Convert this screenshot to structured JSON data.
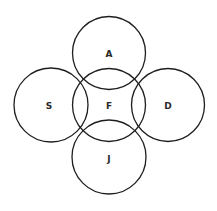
{
  "diagram": {
    "type": "overlapping-circles",
    "stroke_color": "#1e1e1e",
    "circles": [
      {
        "label": "A",
        "cx": 109,
        "cy": 53,
        "r": 36.5
      },
      {
        "label": "S",
        "cx": 51,
        "cy": 105,
        "r": 37
      },
      {
        "label": "F",
        "cx": 109,
        "cy": 105,
        "r": 36.5
      },
      {
        "label": "D",
        "cx": 168,
        "cy": 105,
        "r": 36.5
      },
      {
        "label": "J",
        "cx": 109,
        "cy": 157,
        "r": 37
      }
    ]
  }
}
